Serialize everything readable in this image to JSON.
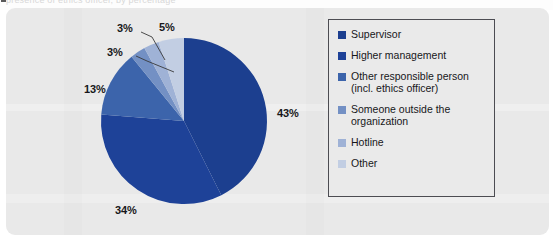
{
  "caption": {
    "text": "presence of ethics officer, by percentage",
    "marker_icon": "square-bullet-icon"
  },
  "chart_data": {
    "type": "pie",
    "title": "",
    "subtitle": "",
    "xlabel": "",
    "ylabel": "",
    "legend_position": "right",
    "grid": false,
    "start_angle_deg": 0,
    "direction": "clockwise",
    "categories": [
      "Supervisor",
      "Higher management",
      "Other responsible person\n(incl. ethics officer)",
      "Someone outside the\norganization",
      "Hotline",
      "Other"
    ],
    "values": [
      43,
      34,
      13,
      3,
      3,
      5
    ],
    "value_labels": [
      "43%",
      "34%",
      "13%",
      "3%",
      "3%",
      "5%"
    ],
    "colors": [
      "#1c3f8f",
      "#1e4298",
      "#3c64ab",
      "#7390c4",
      "#9fb2d6",
      "#c2cee3"
    ],
    "units": "percent",
    "total": 101
  },
  "legend": {
    "items": [
      {
        "label": "Supervisor",
        "color": "#1c3f8f"
      },
      {
        "label": "Higher management",
        "color": "#1e4298"
      },
      {
        "label": "Other responsible person\n(incl. ethics officer)",
        "color": "#3c64ab"
      },
      {
        "label": "Someone outside the\norganization",
        "color": "#7390c4"
      },
      {
        "label": "Hotline",
        "color": "#9fb2d6"
      },
      {
        "label": "Other",
        "color": "#c2cee3"
      }
    ]
  },
  "labels": {
    "supervisor_pct": "43%",
    "higher_management_pct": "34%",
    "other_responsible_pct": "13%",
    "someone_outside_pct": "3%",
    "hotline_pct": "3%",
    "other_pct": "5%"
  },
  "style": {
    "panel_background": "#e9e9e9",
    "legend_border": "#4c4c52",
    "label_color": "#17171a",
    "leader_line_color": "#3a3a3a"
  }
}
